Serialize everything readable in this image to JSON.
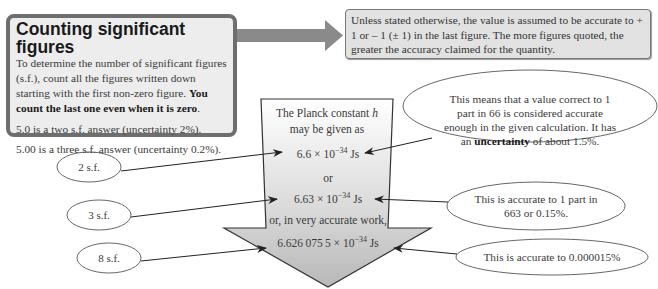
{
  "info_box": {
    "title": "Counting significant figures",
    "body": "To determine the number of significant figures (s.f.), count all the figures written down starting with the first non-zero figure.",
    "emphasis": "You count the last one even when it is zero",
    "emphasis_end": ".",
    "examples": [
      "5.0 is a two s.f. answer (uncertainty 2%).",
      "5.00 is a three s.f. answer (uncertainty 0.2%)."
    ]
  },
  "note_box": {
    "text": "Unless stated otherwise, the value is assumed to be accurate to + 1 or – 1 (± 1) in the last figure. The more figures quoted, the greater the accuracy claimed for the quantity."
  },
  "planck_arrow": {
    "intro_line1": "The Planck constant ",
    "intro_symbol": "h",
    "intro_line2": "may be given as",
    "value1_mantissa": "6.6 × 10",
    "value1_exponent": "−34",
    "value1_unit": " Js",
    "or1": "or",
    "value2_mantissa": "6.63 × 10",
    "value2_exponent": "−34",
    "value2_unit": " Js",
    "or2": "or, in very accurate work,",
    "value3_mantissa": "6.626 075 5 × 10",
    "value3_exponent": "−34",
    "value3_unit": " Js"
  },
  "sf_labels": [
    "2 s.f.",
    "3 s.f.",
    "8 s.f."
  ],
  "callouts": {
    "c1_line1": "This means that a value correct to 1",
    "c1_line2": "part in 66 is considered accurate",
    "c1_line3": "enough in the given calculation. It has",
    "c1_line4_pre": "an ",
    "c1_line4_bold": "uncertainty",
    "c1_line4_post": " of about 1.5%.",
    "c2_line1": "This is accurate to  1 part in",
    "c2_line2": "663 or 0.15%.",
    "c3_line1": "This is accurate to 0.000015%"
  },
  "colors": {
    "box_border": "#6e6e6e",
    "box_fill": "#ededed",
    "arrow_fill_top": "#ffffff",
    "arrow_fill_bottom": "#bdbdbd",
    "connector_arrow": "#8a8a8a"
  }
}
